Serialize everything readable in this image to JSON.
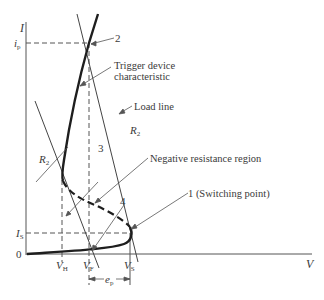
{
  "axes": {
    "y_label": "I",
    "x_label": "V",
    "origin_label": "0"
  },
  "y_ticks": {
    "ip": {
      "main": "i",
      "sub": "p"
    },
    "is": {
      "main": "I",
      "sub": "S"
    }
  },
  "x_ticks": {
    "vh": {
      "main": "V",
      "sub": "H"
    },
    "vf": {
      "main": "V",
      "sub": "F"
    },
    "vs": {
      "main": "V",
      "sub": "S"
    }
  },
  "dimension": {
    "main": "e",
    "sub": "p"
  },
  "annotations": {
    "point_2": "2",
    "trigger_line1": "Trigger device",
    "trigger_line2": "characteristic",
    "load_line": "Load line",
    "r2_right": {
      "main": "R",
      "sub": "2"
    },
    "r2_left": {
      "main": "R",
      "sub": "2"
    },
    "point_3": "3",
    "negative_resistance": "Negative resistance region",
    "point_4": "4",
    "point_1": "1 (Switching point)"
  },
  "colors": {
    "ink": "#2a2a2a",
    "text": "#3a3a3a"
  }
}
